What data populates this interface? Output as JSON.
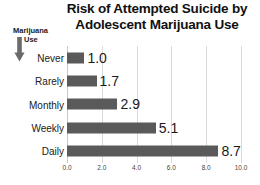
{
  "chart_data": {
    "type": "bar",
    "orientation": "horizontal",
    "title": "Risk of Attempted Suicide by Adolescent Marijuana Use",
    "title_lines": [
      "Risk of Attempted Suicide by",
      "Adolescent Marijuana Use"
    ],
    "categories": [
      "Never",
      "Rarely",
      "Monthly",
      "Weekly",
      "Daily"
    ],
    "values": [
      1.0,
      1.7,
      2.9,
      5.1,
      8.7
    ],
    "value_labels": [
      "1.0",
      "1.7",
      "2.9",
      "5.1",
      "8.7"
    ],
    "xlabel": "",
    "ylabel": "Marijuana Use",
    "xlim": [
      0.0,
      10.0
    ],
    "xticks": [
      0.0,
      2.0,
      4.0,
      6.0,
      8.0,
      10.0
    ],
    "xtick_labels": [
      "0.0",
      "2.0",
      "4.0",
      "6.0",
      "8.0",
      "10.0"
    ],
    "grid": true,
    "grid_axis": "x",
    "legend": false,
    "bar_color": "#5a5a5a",
    "gridline_color": "#d9d9d9",
    "background_color": "#ffffff",
    "text_color": "#1a1a1a"
  },
  "axis_group": {
    "line1": "Marijuana",
    "line2": "Use",
    "arrow_icon": "arrow-down-icon",
    "arrow_direction": "down"
  }
}
